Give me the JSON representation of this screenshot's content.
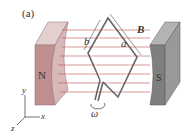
{
  "figure": {
    "panel_label": "(a)",
    "magnets": {
      "north": "N",
      "south": "S"
    },
    "field_label": "B",
    "loop_sides": {
      "side_a": "a",
      "side_b": "b"
    },
    "angular_velocity": "ω",
    "axes": {
      "x": "x",
      "y": "y",
      "z": "z"
    }
  },
  "colors": {
    "north_magnet": "#c79a9b",
    "south_magnet": "#8a8a8a",
    "field_lines": "#c0504d",
    "loop": "#666666"
  }
}
